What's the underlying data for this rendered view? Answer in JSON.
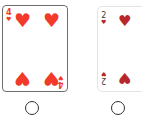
{
  "colors": {
    "left_suit": "#f23a2a",
    "right_suit": "#b8282a",
    "right_rank": "#3a3a3a",
    "radio_border": "#333333"
  },
  "cards": [
    {
      "rank": "4",
      "suit": "hearts",
      "suit_glyph": "♥",
      "pip_count": 4,
      "selected": true
    },
    {
      "rank": "2",
      "suit": "hearts",
      "suit_glyph": "♥",
      "pip_count": 2,
      "selected": false
    }
  ],
  "radios": [
    {
      "for": "card-1",
      "checked": false
    },
    {
      "for": "card-2",
      "checked": false
    }
  ]
}
